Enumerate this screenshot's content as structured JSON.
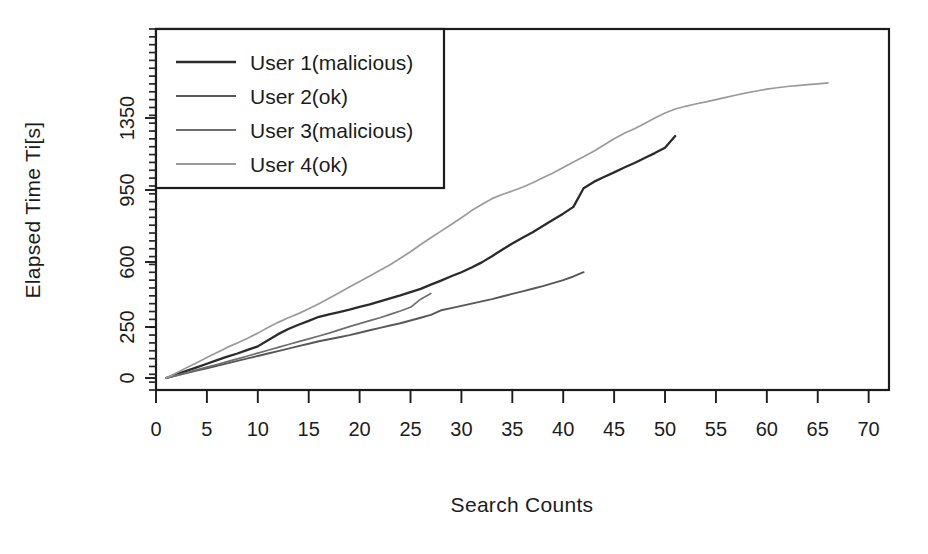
{
  "chart_data": {
    "type": "line",
    "title": "",
    "xlabel": "Search Counts",
    "ylabel": "Elapsed Time Ti[s]",
    "xlim": [
      0,
      72
    ],
    "ylim": [
      0,
      1550
    ],
    "grid": false,
    "legend_position": "top-left",
    "x_ticks": [
      0,
      5,
      10,
      15,
      20,
      25,
      30,
      35,
      40,
      45,
      50,
      55,
      60,
      65,
      70
    ],
    "x_tick_labels": [
      "0",
      "5",
      "10",
      "15",
      "20",
      "25",
      "30",
      "35",
      "40",
      "45",
      "50",
      "55",
      "60",
      "65",
      "70"
    ],
    "y_ticks": [
      0,
      250,
      600,
      950,
      1350
    ],
    "y_tick_labels": [
      "0",
      "250",
      "600",
      "950",
      "1350"
    ],
    "series": [
      {
        "name": "User 1(malicious)",
        "color": "#2b2b2b",
        "x": [
          1,
          2,
          3,
          4,
          5,
          6,
          7,
          8,
          9,
          10,
          11,
          12,
          13,
          14,
          15,
          16,
          17,
          18,
          19,
          20,
          21,
          22,
          23,
          24,
          25,
          26,
          27,
          28,
          29,
          30,
          31,
          32,
          33,
          34,
          35,
          36,
          37,
          38,
          39,
          40,
          41,
          42,
          43,
          44,
          45,
          46,
          47,
          48,
          49,
          50,
          51
        ],
        "y": [
          0,
          18,
          35,
          52,
          70,
          88,
          105,
          120,
          138,
          155,
          185,
          215,
          240,
          262,
          283,
          305,
          318,
          330,
          343,
          358,
          372,
          388,
          404,
          420,
          438,
          455,
          478,
          500,
          523,
          545,
          570,
          598,
          628,
          660,
          690,
          718,
          745,
          775,
          805,
          835,
          868,
          960,
          995,
          1022,
          1048,
          1075,
          1100,
          1128,
          1155,
          1185,
          1250
        ]
      },
      {
        "name": "User 2(ok)",
        "color": "#585858",
        "x": [
          1,
          2,
          3,
          4,
          5,
          6,
          7,
          8,
          9,
          10,
          11,
          12,
          13,
          14,
          15,
          16,
          17,
          18,
          19,
          20,
          21,
          22,
          23,
          24,
          25,
          26,
          27,
          28,
          29,
          30,
          31,
          32,
          33,
          34,
          35,
          36,
          37,
          38,
          39,
          40,
          41,
          42
        ],
        "y": [
          0,
          12,
          24,
          36,
          48,
          60,
          72,
          84,
          96,
          108,
          120,
          132,
          144,
          156,
          168,
          180,
          190,
          200,
          210,
          222,
          234,
          246,
          258,
          270,
          285,
          300,
          315,
          340,
          352,
          364,
          376,
          388,
          400,
          414,
          428,
          442,
          456,
          470,
          486,
          502,
          522,
          545
        ]
      },
      {
        "name": "User 3(malicious)",
        "color": "#6e6e6e",
        "x": [
          1,
          2,
          3,
          4,
          5,
          6,
          7,
          8,
          9,
          10,
          11,
          12,
          13,
          14,
          15,
          16,
          17,
          18,
          19,
          20,
          21,
          22,
          23,
          24,
          25,
          26,
          27
        ],
        "y": [
          0,
          13,
          26,
          40,
          53,
          66,
          80,
          94,
          108,
          122,
          136,
          150,
          164,
          178,
          192,
          206,
          220,
          236,
          252,
          268,
          284,
          300,
          318,
          336,
          356,
          400,
          430
        ]
      },
      {
        "name": "User 4(ok)",
        "color": "#9a9a9a",
        "x": [
          1,
          2,
          3,
          4,
          5,
          6,
          7,
          8,
          9,
          10,
          11,
          12,
          13,
          14,
          15,
          16,
          17,
          18,
          19,
          20,
          21,
          22,
          23,
          24,
          25,
          26,
          27,
          28,
          29,
          30,
          31,
          32,
          33,
          34,
          35,
          36,
          37,
          38,
          39,
          40,
          41,
          42,
          43,
          44,
          45,
          46,
          47,
          48,
          49,
          50,
          51,
          52,
          53,
          54,
          55,
          56,
          57,
          58,
          59,
          60,
          61,
          62,
          63,
          64,
          65,
          66
        ],
        "y": [
          0,
          25,
          50,
          75,
          100,
          125,
          150,
          172,
          195,
          220,
          248,
          275,
          300,
          322,
          348,
          375,
          405,
          435,
          465,
          495,
          525,
          555,
          585,
          618,
          650,
          685,
          718,
          750,
          782,
          815,
          850,
          880,
          908,
          928,
          945,
          965,
          990,
          1018,
          1045,
          1075,
          1105,
          1135,
          1165,
          1200,
          1235,
          1265,
          1290,
          1320,
          1350,
          1378,
          1400,
          1415,
          1428,
          1440,
          1452,
          1465,
          1478,
          1490,
          1500,
          1510,
          1518,
          1525,
          1530,
          1535,
          1540,
          1545
        ]
      }
    ]
  },
  "legend": {
    "entries": [
      {
        "label": "User 1(malicious)",
        "color": "#2b2b2b"
      },
      {
        "label": "User 2(ok)",
        "color": "#585858"
      },
      {
        "label": "User 3(malicious)",
        "color": "#6e6e6e"
      },
      {
        "label": "User 4(ok)",
        "color": "#9a9a9a"
      }
    ]
  },
  "axes": {
    "x_title": "Search Counts",
    "y_title": "Elapsed Time Ti[s]"
  }
}
